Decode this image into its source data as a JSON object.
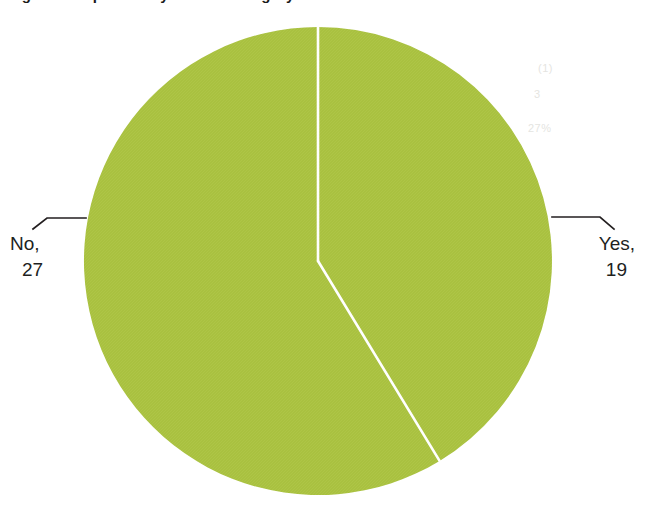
{
  "page": {
    "background_color": "#ffffff",
    "title_fragment": "Figure: Responses by answer category",
    "ghost_marks": [
      "(1)",
      "3",
      "27%"
    ]
  },
  "chart_data": {
    "type": "pie",
    "title": "",
    "subtitle": "",
    "xlabel": "",
    "ylabel": "",
    "legend_position": "none",
    "grid": false,
    "total": 46,
    "slice_color": "#a9c140",
    "separator_color": "#ffffff",
    "leader_line_color": "#231f20",
    "label_text_color": "#211f1e",
    "start_angle_deg": 0,
    "direction": "clockwise",
    "categories": [
      "Yes",
      "No"
    ],
    "values": [
      19,
      27
    ],
    "slices": [
      {
        "name": "Yes",
        "label": "Yes,",
        "value": 19,
        "value_text": "19",
        "percent": 41.3,
        "angle_deg": 148.7,
        "start_deg": 0,
        "end_deg": 148.7,
        "color": "#a9c140"
      },
      {
        "name": "No",
        "label": "No,",
        "value": 27,
        "value_text": "27",
        "percent": 58.7,
        "angle_deg": 211.3,
        "start_deg": 148.7,
        "end_deg": 360,
        "color": "#a9c140"
      }
    ],
    "geometry": {
      "center_x": 318,
      "center_y": 261,
      "radius": 234
    }
  }
}
